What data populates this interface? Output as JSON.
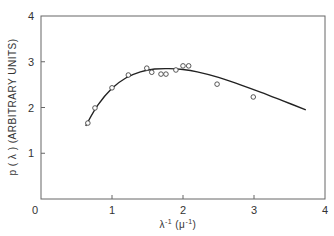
{
  "chart_data": {
    "type": "scatter",
    "title": "",
    "xlabel": "λ⁻¹ (μ⁻¹)",
    "ylabel": "p(λ) (ARBITRARY UNITS)",
    "xlim": [
      0,
      4
    ],
    "ylim": [
      0,
      4
    ],
    "grid": false,
    "legend": null,
    "x_ticks": [
      "0",
      "1",
      "2",
      "3",
      "4"
    ],
    "y_ticks": [
      "1",
      "2",
      "3",
      "4"
    ],
    "series": [
      {
        "name": "measured",
        "kind": "scatter",
        "marker": "open-circle",
        "x": [
          0.66,
          0.76,
          1.0,
          1.23,
          1.49,
          1.56,
          1.69,
          1.76,
          1.9,
          2.0,
          2.08,
          2.48,
          2.99
        ],
        "y": [
          1.66,
          1.99,
          2.43,
          2.71,
          2.86,
          2.77,
          2.73,
          2.73,
          2.82,
          2.91,
          2.91,
          2.51,
          2.23
        ]
      },
      {
        "name": "fit",
        "kind": "line",
        "x": [
          0.63,
          0.8,
          1.0,
          1.2,
          1.4,
          1.6,
          1.8,
          2.0,
          2.2,
          2.5,
          2.8,
          3.1,
          3.4,
          3.73
        ],
        "y": [
          1.6,
          2.05,
          2.42,
          2.65,
          2.78,
          2.84,
          2.85,
          2.83,
          2.78,
          2.66,
          2.5,
          2.33,
          2.15,
          1.95
        ]
      }
    ]
  },
  "labels": {
    "xlabel_base": "λ",
    "xlabel_sup": "-1",
    "xlabel_unit_open": "(",
    "xlabel_unit_base": "μ",
    "xlabel_unit_sup": "-1",
    "xlabel_unit_close": ")",
    "ylabel": "p ( λ )  (ARBITRARY  UNITS)"
  }
}
